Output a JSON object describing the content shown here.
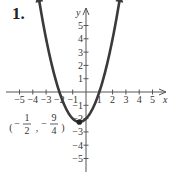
{
  "problem_number": "1.",
  "chart_data": {
    "type": "line",
    "title": "",
    "function": "y = x^2 + x - 2",
    "xlabel": "x",
    "ylabel": "y",
    "xlim": [
      -5.5,
      5.5
    ],
    "ylim": [
      -6,
      6
    ],
    "x_ticks": [
      -5,
      -4,
      -3,
      -2,
      -1,
      1,
      2,
      3,
      4,
      5
    ],
    "y_ticks": [
      -5,
      -4,
      -3,
      -2,
      -1,
      1,
      2,
      3,
      4,
      5
    ],
    "series": [
      {
        "name": "parabola",
        "x_range": [
          -3.6,
          2.6
        ]
      }
    ],
    "annotations": [
      {
        "point": [
          -0.5,
          -2.25
        ],
        "label": "(-1/2, -9/4)"
      }
    ],
    "grid": false
  }
}
